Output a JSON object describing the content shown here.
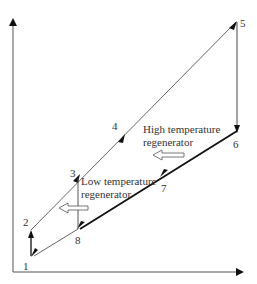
{
  "diagram": {
    "type": "thermodynamic-cycle",
    "axes": {
      "x_label": "",
      "y_label": ""
    },
    "points": [
      {
        "id": "1",
        "label": "1"
      },
      {
        "id": "2",
        "label": "2"
      },
      {
        "id": "3",
        "label": "3"
      },
      {
        "id": "4",
        "label": "4"
      },
      {
        "id": "5",
        "label": "5"
      },
      {
        "id": "6",
        "label": "6"
      },
      {
        "id": "7",
        "label": "7"
      },
      {
        "id": "8",
        "label": "8"
      }
    ],
    "annotations": {
      "high_regen_line1": "High temperature",
      "high_regen_line2": "regenerator",
      "low_regen_line1": "Low temperature",
      "low_regen_line2": "regenerator"
    },
    "colors": {
      "line": "#222222",
      "thin_line": "#555555",
      "text": "#333333"
    }
  }
}
